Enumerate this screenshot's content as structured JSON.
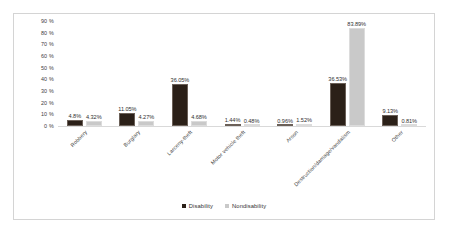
{
  "chart_data": {
    "type": "bar",
    "title": "",
    "subtitle": "",
    "xlabel": "",
    "ylabel": "",
    "ylim": [
      0,
      90
    ],
    "grid": false,
    "legend_position": "bottom-center",
    "categories": [
      "Robbery",
      "Burglary",
      "Larceny-theft",
      "Motor vehicle theft",
      "Arson",
      "Destruction/damage/vandalism",
      "Other"
    ],
    "ytick_labels": [
      "90 %",
      "80 %",
      "70 %",
      "60 %",
      "50 %",
      "40 %",
      "30 %",
      "20 %",
      "10 %",
      "0 %"
    ],
    "ytick_values": [
      90,
      80,
      70,
      60,
      50,
      40,
      30,
      20,
      10,
      0
    ],
    "series": [
      {
        "name": "Disability",
        "color": "#2b2018",
        "values": [
          4.8,
          11.05,
          36.05,
          1.44,
          0.96,
          36.53,
          9.13
        ],
        "data_labels": [
          "4.8%",
          "11.05%",
          "36.05%",
          "1.44%",
          "0.96%",
          "36.53%",
          "9.13%"
        ]
      },
      {
        "name": "Nondisability",
        "color": "#c9c9c9",
        "values": [
          4.32,
          4.27,
          4.68,
          0.48,
          1.52,
          83.89,
          0.81
        ],
        "data_labels": [
          "4.32%",
          "4.27%",
          "4.68%",
          "0.48%",
          "1.52%",
          "83.89%",
          "0.81%"
        ]
      }
    ]
  }
}
